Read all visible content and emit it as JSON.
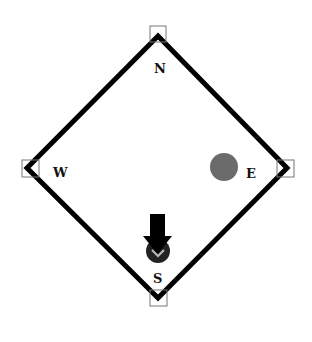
{
  "diagram": {
    "type": "compass-diamond",
    "labels": {
      "north": "N",
      "south": "S",
      "east": "E",
      "west": "W"
    },
    "corner_markers": [
      "north",
      "east",
      "south",
      "west"
    ],
    "circle_marker": {
      "position": "near-east",
      "color": "#6b6b6b"
    },
    "arrow_marker": {
      "position": "near-south",
      "direction": "down",
      "color": "#000000"
    },
    "colors": {
      "outline": "#000000",
      "corner_box": "#777777",
      "background": "#ffffff"
    }
  }
}
